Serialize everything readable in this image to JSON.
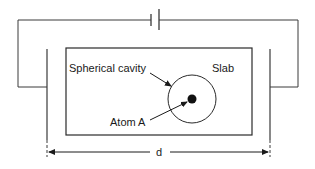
{
  "diagram": {
    "labels": {
      "cavity": "Spherical cavity",
      "slab": "Slab",
      "atom": "Atom A",
      "distance": "d"
    },
    "components": {
      "battery": "battery-symbol",
      "left_plate": "capacitor-plate-left",
      "right_plate": "capacitor-plate-right",
      "slab": "dielectric-slab",
      "cavity": "spherical-cavity",
      "atom": "atom-dot"
    },
    "colors": {
      "line": "#3a3a3a",
      "text": "#1a1a1a",
      "background": "#ffffff"
    }
  }
}
